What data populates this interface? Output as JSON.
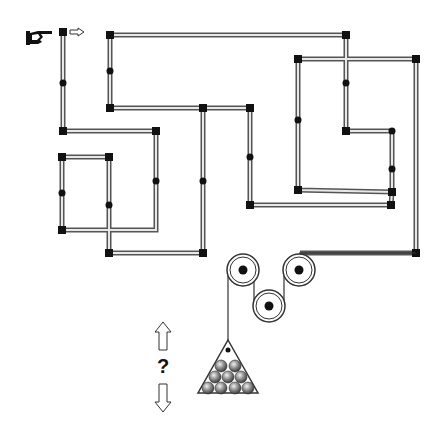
{
  "puzzle": {
    "question_mark": "?",
    "colors": {
      "pipe_outer": "#555555",
      "pipe_inner": "#e8e8e8",
      "node": "#111111",
      "rope": "#333333",
      "ball": "#777777"
    },
    "start_icon": "pointing-hand-icon",
    "direction_hint_icon": "arrow-right-icon",
    "answer_options": [
      "arrow-up-icon",
      "arrow-down-icon"
    ]
  }
}
